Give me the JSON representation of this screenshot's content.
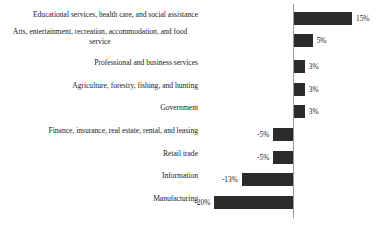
{
  "chart_data": {
    "type": "bar",
    "orientation": "horizontal",
    "title": "",
    "subtitle": "",
    "xlabel": "",
    "ylabel": "",
    "grid": false,
    "legend": null,
    "axis": {
      "zero_line": true,
      "xlim": [
        -20,
        15
      ],
      "tick_labels": []
    },
    "value_suffix": "%",
    "categories": [
      "Educational services, health care, and social assistance",
      "Arts, entertainment, recreation, accommodation, and food service",
      "Professional and business services",
      "Agriculture, forestry, fishing, and hunting",
      "Government",
      "Finance, insurance, real estate, rental, and leasing",
      "Retail trade",
      "Information",
      "Manufacturing"
    ],
    "values": [
      15,
      5,
      3,
      3,
      3,
      -5,
      -5,
      -13,
      -20
    ],
    "data_labels": [
      "15%",
      "5%",
      "3%",
      "3%",
      "3%",
      "-5%",
      "-5%",
      "-13%",
      "-20%"
    ],
    "colors": {
      "bar": "#2b2b2b",
      "axis": "#9a9a9a",
      "text": "#1a1a1a",
      "background": "#ffffff"
    }
  },
  "rows": [
    {
      "label": "Educational services, health care, and social assistance",
      "value_label": "15%",
      "two_line": false
    },
    {
      "label": "Arts, entertainment, recreation, accommodation, and food service",
      "value_label": "5%",
      "two_line": true
    },
    {
      "label": "Professional and business services",
      "value_label": "3%",
      "two_line": false
    },
    {
      "label": "Agriculture, forestry, fishing, and hunting",
      "value_label": "3%",
      "two_line": false
    },
    {
      "label": "Government",
      "value_label": "3%",
      "two_line": false
    },
    {
      "label": "Finance, insurance, real estate, rental, and leasing",
      "value_label": "-5%",
      "two_line": false
    },
    {
      "label": "Retail trade",
      "value_label": "-5%",
      "two_line": false
    },
    {
      "label": "Information",
      "value_label": "-13%",
      "two_line": false
    },
    {
      "label": "Manufacturing",
      "value_label": "-20%",
      "two_line": false
    }
  ]
}
